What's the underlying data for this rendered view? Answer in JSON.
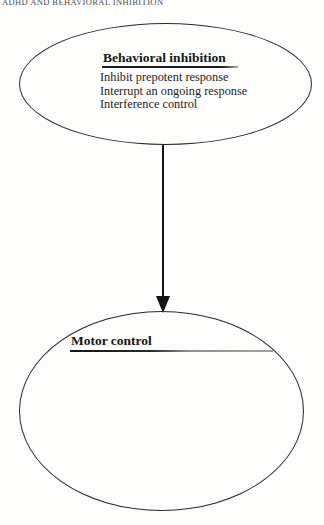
{
  "page": {
    "running_head": "ADHD AND BEHAVIORAL INHIBITION"
  },
  "diagram": {
    "nodes": [
      {
        "id": "behavioral-inhibition",
        "shape": "ellipse",
        "title": "Behavioral inhibition",
        "items": [
          "Inhibit prepotent response",
          "Interrupt an ongoing response",
          "Interference control"
        ]
      },
      {
        "id": "motor-control",
        "shape": "ellipse",
        "title": "Motor control",
        "items": []
      }
    ],
    "edges": [
      {
        "from": "behavioral-inhibition",
        "to": "motor-control",
        "style": "solid",
        "direction": "down",
        "arrowhead": "filled-triangle"
      }
    ],
    "colors": {
      "ink": "#1b1b1b",
      "node_border": "#2b2b2b",
      "underline_fade": "#a3a3a1",
      "background": "#fdfdfc"
    }
  }
}
